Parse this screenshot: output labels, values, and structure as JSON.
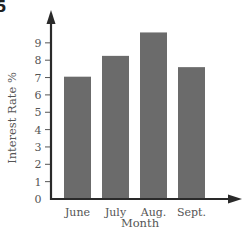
{
  "figure_number": "5",
  "chart_data": {
    "type": "bar",
    "title": "",
    "categories": [
      "June",
      "July",
      "Aug.",
      "Sept."
    ],
    "values": [
      7.05,
      8.25,
      9.6,
      7.6
    ],
    "xlabel": "Month",
    "ylabel": "Interest Rate %",
    "ylim": [
      0,
      10
    ],
    "yticks": [
      "0",
      "1",
      "2",
      "3",
      "4",
      "5",
      "6",
      "7",
      "8",
      "9"
    ],
    "grid": false,
    "legend": null,
    "bar_color": "#6b6b6b",
    "axis_color": "#2a2a2a"
  }
}
